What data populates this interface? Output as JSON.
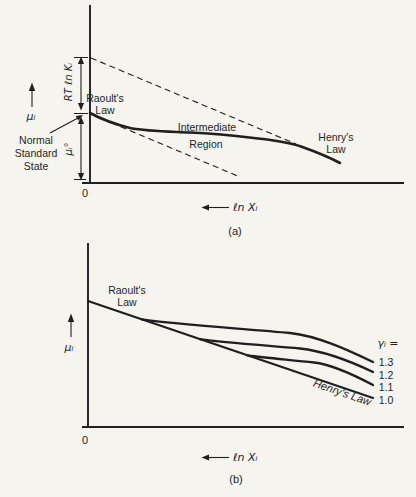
{
  "colors": {
    "background": "#f5f4ef",
    "ink": "#1f1f1f"
  },
  "panel_a": {
    "caption": "(a)",
    "origin_label": "0",
    "y_axis_symbol": "μᵢ",
    "x_axis_label": "ℓn Xᵢ",
    "bracket_rt_ln_k": "RT ℓn Kᵢ",
    "bracket_mu_standard": "μᵢ°",
    "labels": {
      "raoults_law": [
        "Raoult's",
        "Law"
      ],
      "intermediate_region": [
        "Intermediate",
        "Region"
      ],
      "henrys_law": [
        "Henry's",
        "Law"
      ],
      "normal_standard_state": [
        "Normal",
        "Standard",
        "State"
      ]
    }
  },
  "panel_b": {
    "caption": "(b)",
    "origin_label": "0",
    "y_axis_symbol": "μᵢ",
    "x_axis_label": "ℓn Xᵢ",
    "labels": {
      "raoults_law": [
        "Raoult's",
        "Law"
      ],
      "henrys_law": "Henry's Law",
      "gamma_legend": "γᵢ =",
      "gamma_values": [
        "1.3",
        "1.2",
        "1.1",
        "1.0"
      ]
    }
  }
}
